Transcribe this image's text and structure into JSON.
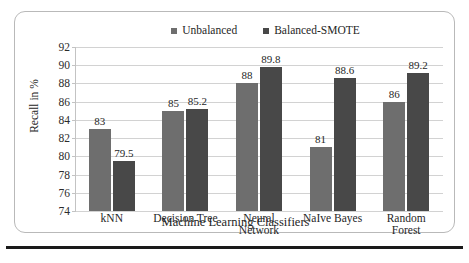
{
  "figure": {
    "frame_border_color": "#b9b9b9",
    "rule_color": "#1a1a1a"
  },
  "legend": {
    "position": "top-right",
    "entries": [
      {
        "label": "Unbalanced",
        "color": "#6e6e6e",
        "marker": "square-swatch"
      },
      {
        "label": "Balanced-SMOTE",
        "color": "#484848",
        "marker": "square-swatch"
      }
    ]
  },
  "chart_data": {
    "type": "bar",
    "title": "",
    "xlabel": "Machine Learning Classifiers",
    "ylabel": "Recall in %",
    "ylim": [
      74,
      92
    ],
    "ytick_step": 2,
    "yticks": [
      92,
      90,
      88,
      86,
      84,
      82,
      80,
      78,
      76,
      74
    ],
    "grid": true,
    "legend_position": "top-right",
    "categories": [
      "kNN",
      "Decision Tree",
      "Neural Network",
      "NaIve Bayes",
      "Random Forest"
    ],
    "category_lines": [
      [
        "kNN"
      ],
      [
        "Decision Tree"
      ],
      [
        "Neural",
        "Network"
      ],
      [
        "NaIve Bayes"
      ],
      [
        "Random",
        "Forest"
      ]
    ],
    "series": [
      {
        "name": "Unbalanced",
        "color": "#6e6e6e",
        "values": [
          83,
          85,
          88,
          81,
          86
        ],
        "labels": [
          "83",
          "85",
          "88",
          "81",
          "86"
        ]
      },
      {
        "name": "Balanced-SMOTE",
        "color": "#484848",
        "values": [
          79.5,
          85.2,
          89.8,
          88.6,
          89.2
        ],
        "labels": [
          "79.5",
          "85.2",
          "89.8",
          "88.6",
          "89.2"
        ]
      }
    ]
  }
}
